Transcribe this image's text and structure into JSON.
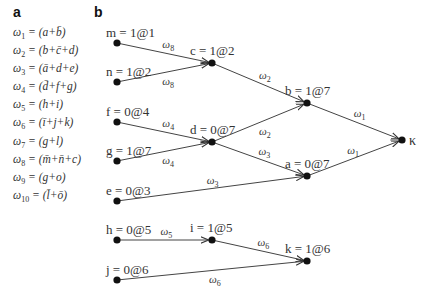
{
  "panel_a": {
    "letter": "a",
    "equations": [
      {
        "lhs": "ω",
        "sub": "1",
        "rhs": " = (a+b̄)"
      },
      {
        "lhs": "ω",
        "sub": "2",
        "rhs": " = (b+c̄+d)"
      },
      {
        "lhs": "ω",
        "sub": "3",
        "rhs": " = (ā+d+e)"
      },
      {
        "lhs": "ω",
        "sub": "4",
        "rhs": " = (d̄+f+g)"
      },
      {
        "lhs": "ω",
        "sub": "5",
        "rhs": " = (h+i)"
      },
      {
        "lhs": "ω",
        "sub": "6",
        "rhs": " = (ī+j+k)"
      },
      {
        "lhs": "ω",
        "sub": "7",
        "rhs": " = (g+l)"
      },
      {
        "lhs": "ω",
        "sub": "8",
        "rhs": " = (m̄+n̄+c)"
      },
      {
        "lhs": "ω",
        "sub": "9",
        "rhs": " = (g+o)"
      },
      {
        "lhs": "ω",
        "sub": "10",
        "rhs": " = (l̄+ō)"
      }
    ]
  },
  "panel_b": {
    "letter": "b",
    "nodes": [
      {
        "id": "m",
        "label": "m = 1@1",
        "x": 117,
        "y": 43
      },
      {
        "id": "n",
        "label": "n = 1@2",
        "x": 117,
        "y": 82
      },
      {
        "id": "f",
        "label": "f = 0@4",
        "x": 117,
        "y": 122
      },
      {
        "id": "g",
        "label": "g = 1@7",
        "x": 117,
        "y": 161
      },
      {
        "id": "e",
        "label": "e = 0@3",
        "x": 117,
        "y": 201
      },
      {
        "id": "h",
        "label": "h = 0@5",
        "x": 117,
        "y": 240
      },
      {
        "id": "j",
        "label": "j = 0@6",
        "x": 117,
        "y": 280
      },
      {
        "id": "c",
        "label": "c = 1@2",
        "x": 212,
        "y": 63
      },
      {
        "id": "d",
        "label": "d = 0@7",
        "x": 212,
        "y": 142
      },
      {
        "id": "b",
        "label": "b = 1@7",
        "x": 307,
        "y": 103
      },
      {
        "id": "a",
        "label": "a = 0@7",
        "x": 307,
        "y": 176
      },
      {
        "id": "i",
        "label": "i = 1@5",
        "x": 212,
        "y": 240
      },
      {
        "id": "k",
        "label": "k = 1@6",
        "x": 307,
        "y": 261
      },
      {
        "id": "kappa",
        "label": "κ",
        "x": 402,
        "y": 140
      }
    ],
    "edges": [
      {
        "from": "m",
        "to": "c",
        "weight": "ω",
        "sub": "8"
      },
      {
        "from": "n",
        "to": "c",
        "weight": "ω",
        "sub": "8"
      },
      {
        "from": "f",
        "to": "d",
        "weight": "ω",
        "sub": "4"
      },
      {
        "from": "g",
        "to": "d",
        "weight": "ω",
        "sub": "4"
      },
      {
        "from": "c",
        "to": "b",
        "weight": "ω",
        "sub": "2"
      },
      {
        "from": "d",
        "to": "b",
        "weight": "ω",
        "sub": "2"
      },
      {
        "from": "d",
        "to": "a",
        "weight": "ω",
        "sub": "3"
      },
      {
        "from": "e",
        "to": "a",
        "weight": "ω",
        "sub": "3"
      },
      {
        "from": "b",
        "to": "kappa",
        "weight": "ω",
        "sub": "1"
      },
      {
        "from": "a",
        "to": "kappa",
        "weight": "ω",
        "sub": "1"
      },
      {
        "from": "h",
        "to": "i",
        "weight": "ω",
        "sub": "5"
      },
      {
        "from": "i",
        "to": "k",
        "weight": "ω",
        "sub": "6"
      },
      {
        "from": "j",
        "to": "k",
        "weight": "ω",
        "sub": "6"
      }
    ]
  }
}
